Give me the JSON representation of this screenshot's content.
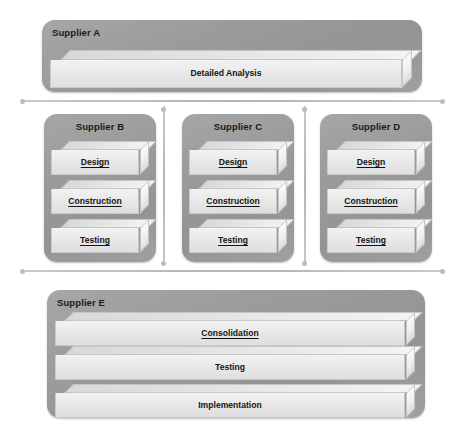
{
  "diagram": {
    "background_color": "#ffffff",
    "panel_color": "#9b9b9b",
    "block_color": "#e9e9e9",
    "connector_color": "#bdbdbd"
  },
  "suppliers": [
    {
      "id": "supplier-a",
      "label": "Supplier A",
      "label_align": "left",
      "blocks": [
        {
          "label": "Detailed Analysis",
          "underline": false
        }
      ]
    },
    {
      "id": "supplier-b",
      "label": "Supplier B",
      "label_align": "center",
      "blocks": [
        {
          "label": "Design",
          "underline": true
        },
        {
          "label": "Construction",
          "underline": true
        },
        {
          "label": "Testing",
          "underline": true
        }
      ]
    },
    {
      "id": "supplier-c",
      "label": "Supplier C",
      "label_align": "center",
      "blocks": [
        {
          "label": "Design",
          "underline": true
        },
        {
          "label": "Construction",
          "underline": true
        },
        {
          "label": "Testing",
          "underline": true
        }
      ]
    },
    {
      "id": "supplier-d",
      "label": "Supplier D",
      "label_align": "center",
      "blocks": [
        {
          "label": "Design",
          "underline": true
        },
        {
          "label": "Construction",
          "underline": true
        },
        {
          "label": "Testing",
          "underline": true
        }
      ]
    },
    {
      "id": "supplier-e",
      "label": "Supplier E",
      "label_align": "left",
      "blocks": [
        {
          "label": "Consolidation",
          "underline": true
        },
        {
          "label": "Testing",
          "underline": false
        },
        {
          "label": "Implementation",
          "underline": false
        }
      ]
    }
  ]
}
